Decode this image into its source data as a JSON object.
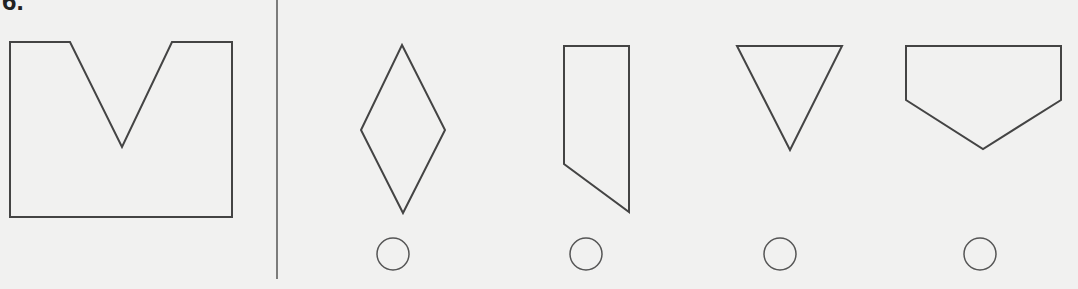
{
  "question": {
    "number_label": "6.",
    "stroke_color": "#444444",
    "background": "#f1f1f0",
    "reference_shape": {
      "name": "square-with-v-notch",
      "points": "10,42 70,42 122,147 172,42 232,42 232,217 10,217"
    },
    "options": [
      {
        "name": "diamond",
        "points": "402,45 445,130 403,213 361,130",
        "radio": {
          "cx": 393,
          "cy": 254
        }
      },
      {
        "name": "tall-pentagon",
        "points": "564,46 629,46 629,212 564,164",
        "radio": {
          "cx": 586,
          "cy": 254
        }
      },
      {
        "name": "inverted-triangle",
        "points": "737,46 842,46 790,150",
        "radio": {
          "cx": 780,
          "cy": 254
        }
      },
      {
        "name": "house-pentagon",
        "points": "906,46 1061,46 1061,100 983,149 906,100",
        "radio": {
          "cx": 980,
          "cy": 254
        }
      }
    ]
  }
}
